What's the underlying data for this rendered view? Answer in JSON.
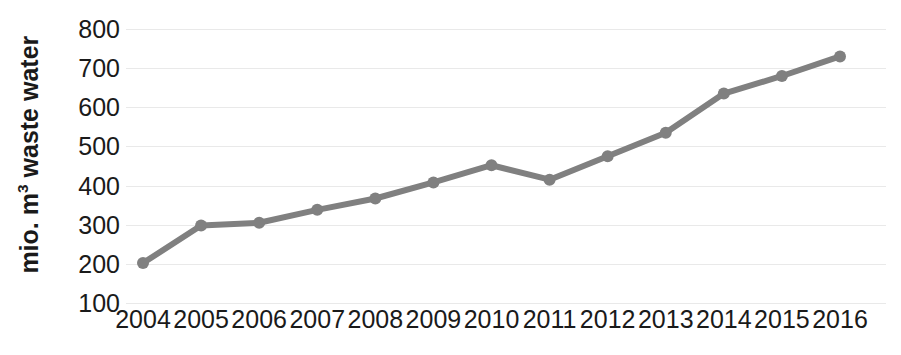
{
  "chart_data": {
    "type": "line",
    "title": "",
    "subtitle": "",
    "xlabel": "",
    "ylabel": "mio. m³ waste water",
    "ylabel_text": "mio. m",
    "ylabel_superscript": "3",
    "ylabel_suffix": " waste water",
    "categories": [
      "2004",
      "2005",
      "2006",
      "2007",
      "2008",
      "2009",
      "2010",
      "2011",
      "2012",
      "2013",
      "2014",
      "2015",
      "2016"
    ],
    "values": [
      202,
      298,
      305,
      338,
      367,
      408,
      452,
      415,
      475,
      535,
      635,
      680,
      730
    ],
    "series": [
      {
        "name": "waste water",
        "values": [
          202,
          298,
          305,
          338,
          367,
          408,
          452,
          415,
          475,
          535,
          635,
          680,
          730
        ]
      }
    ],
    "ylim": [
      100,
      800
    ],
    "yticks": [
      800,
      700,
      600,
      500,
      400,
      300,
      200,
      100
    ],
    "ytick_labels": [
      "800",
      "700",
      "600",
      "500",
      "400",
      "300",
      "200",
      "100"
    ],
    "xtick_labels": [
      "2004",
      "2005",
      "2006",
      "2007",
      "2008",
      "2009",
      "2010",
      "2011",
      "2012",
      "2013",
      "2014",
      "2015",
      "2016"
    ],
    "grid": true,
    "grid_axis": "y",
    "legend": false,
    "legend_position": "none",
    "annotations": [],
    "colors": {
      "line": "#808080",
      "marker": "#808080",
      "gridline": "#e9e9e9",
      "text": "#1a1a1a",
      "background": "#ffffff"
    },
    "style": {
      "line_width": 6,
      "marker_radius": 6,
      "marker_shape": "circle"
    }
  }
}
